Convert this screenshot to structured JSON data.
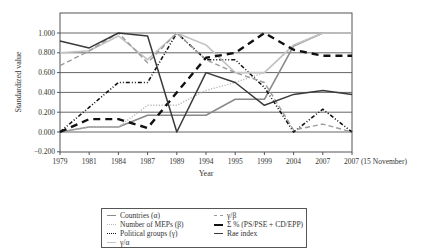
{
  "chart_data": {
    "type": "line",
    "title": "",
    "xlabel": "Year",
    "ylabel": "Standardized value",
    "ylim": [
      -0.2,
      1.1
    ],
    "yticks": [
      "−0.200",
      "0.000",
      "0.200",
      "0.400",
      "0.600",
      "0.800",
      "1.000"
    ],
    "grid": true,
    "legend_position": "bottom",
    "categories": [
      "1979",
      "1981",
      "1984",
      "1987",
      "1989",
      "1994",
      "1995",
      "1999",
      "2004",
      "2007",
      "2007 (15 November)"
    ],
    "series": [
      {
        "name": "Countries (α)",
        "color": "#8a8a8a",
        "style": "solid",
        "width": 1.6,
        "values": [
          0.0,
          0.05,
          0.05,
          0.17,
          0.17,
          0.17,
          0.33,
          0.33,
          0.87,
          1.0,
          1.0
        ]
      },
      {
        "name": "Number of MEPs (β)",
        "color": "#b8b8b8",
        "style": "dotted",
        "width": 1.4,
        "values": [
          0.0,
          0.05,
          0.05,
          0.27,
          0.27,
          0.42,
          0.5,
          0.6,
          0.87,
          1.0,
          1.0
        ]
      },
      {
        "name": "Political groups (γ)",
        "color": "#111111",
        "style": "dashdot",
        "width": 1.6,
        "values": [
          0.0,
          0.25,
          0.5,
          0.5,
          1.0,
          0.73,
          0.73,
          0.45,
          0.0,
          0.23,
          0.0
        ]
      },
      {
        "name": "γ/α",
        "color": "#c4c4c4",
        "style": "solid",
        "width": 1.6,
        "values": [
          0.8,
          0.82,
          0.97,
          0.73,
          1.0,
          0.88,
          0.6,
          0.6,
          0.88,
          1.0,
          1.0
        ]
      },
      {
        "name": "γ/β",
        "color": "#9a9a9a",
        "style": "dashed",
        "width": 1.4,
        "values": [
          0.67,
          0.82,
          1.0,
          0.7,
          1.0,
          0.73,
          0.6,
          0.5,
          0.02,
          0.08,
          0.0
        ]
      },
      {
        "name": "Σ % (PS/PSE + CD/EPP)",
        "color": "#111111",
        "style": "bolddash",
        "width": 2.4,
        "values": [
          0.0,
          0.13,
          0.13,
          0.04,
          0.4,
          0.75,
          0.8,
          1.0,
          0.83,
          0.77,
          0.77
        ]
      },
      {
        "name": "Rae index",
        "color": "#3a3a3a",
        "style": "solid",
        "width": 1.5,
        "values": [
          0.92,
          0.85,
          1.0,
          0.97,
          0.0,
          0.6,
          0.5,
          0.27,
          0.38,
          0.42,
          0.38
        ]
      }
    ]
  },
  "legend": {
    "items": [
      {
        "label": "Countries (α)"
      },
      {
        "label": "γ/β"
      },
      {
        "label": "Number of MEPs (β)"
      },
      {
        "label": "Σ % (PS/PSE + CD/EPP)"
      },
      {
        "label": "Political groups (γ)"
      },
      {
        "label": "Rae index"
      },
      {
        "label": "γ/α"
      }
    ]
  }
}
